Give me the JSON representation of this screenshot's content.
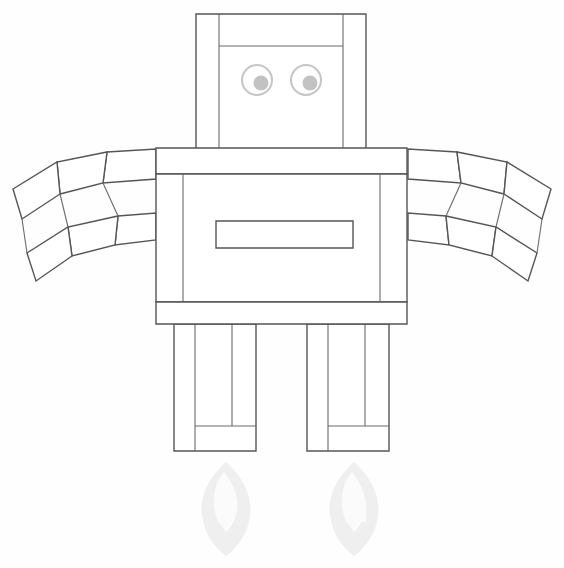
{
  "document": {
    "title": "Robot Line Drawing",
    "background_color": "#fefefe",
    "width": 564,
    "height": 568,
    "line_color": "#555555",
    "eye_color": "#c2c2c2",
    "shadow_color": "#efefef"
  },
  "figure": {
    "name": "robot",
    "parts": [
      {
        "id": "head",
        "label": "Head"
      },
      {
        "id": "eye-left",
        "label": "Left Eye"
      },
      {
        "id": "eye-right",
        "label": "Right Eye"
      },
      {
        "id": "shoulder-bar",
        "label": "Shoulder Bar"
      },
      {
        "id": "torso",
        "label": "Torso"
      },
      {
        "id": "chest-slot",
        "label": "Chest Slot"
      },
      {
        "id": "hip-bar",
        "label": "Hip Bar"
      },
      {
        "id": "arm-left",
        "label": "Left Arm"
      },
      {
        "id": "arm-right",
        "label": "Right Arm"
      },
      {
        "id": "leg-left",
        "label": "Left Leg"
      },
      {
        "id": "leg-right",
        "label": "Right Leg"
      },
      {
        "id": "flame-left",
        "label": "Left Exhaust Flame"
      },
      {
        "id": "flame-right",
        "label": "Right Exhaust Flame"
      }
    ]
  },
  "geometry": {
    "head": {
      "outer": {
        "x": 196,
        "y": 14,
        "w": 170,
        "h": 137
      },
      "inner_left_line_x": 219,
      "inner_right_line_x": 343,
      "inner_top_line_y": 46
    },
    "eyes": {
      "radius": 15,
      "pupil_radius": 7.5,
      "left_center": {
        "cx": 257,
        "cy": 80
      },
      "right_center": {
        "cx": 306,
        "cy": 80
      },
      "pupil_offset": {
        "dx": 4,
        "dy": 3
      }
    },
    "shoulder_bar": {
      "x": 156,
      "y": 148,
      "w": 251,
      "h": 26
    },
    "torso": {
      "x": 156,
      "y": 174,
      "w": 251,
      "h": 128
    },
    "torso_inner_left_x": 183,
    "torso_inner_right_x": 380,
    "chest_slot": {
      "x": 216,
      "y": 221,
      "w": 137,
      "h": 27
    },
    "hip_bar": {
      "x": 156,
      "y": 302,
      "w": 251,
      "h": 22
    },
    "legs": {
      "left": {
        "x": 174,
        "y": 324,
        "w": 82,
        "h": 127
      },
      "right": {
        "x": 307,
        "y": 324,
        "w": 82,
        "h": 127
      },
      "inner_lines_left": [
        195,
        232
      ],
      "inner_lines_right": [
        328,
        365
      ],
      "foot_line_y": 426
    },
    "flames": {
      "left": {
        "cx": 226,
        "cy": 508
      },
      "right": {
        "cx": 354,
        "cy": 508
      }
    }
  }
}
